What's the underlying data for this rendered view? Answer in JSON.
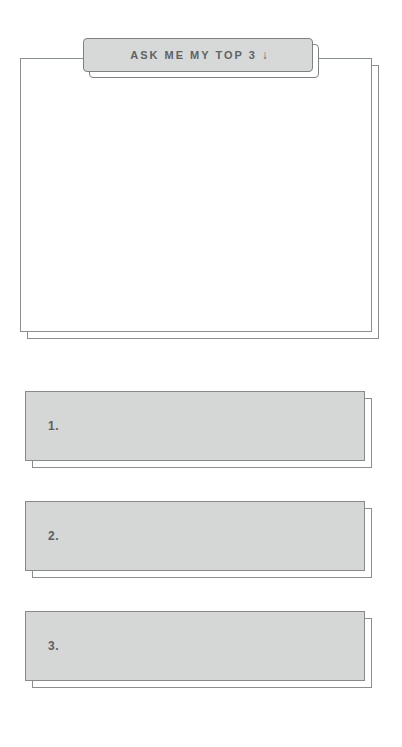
{
  "prompt_card": {
    "tab_label": "ASK ME MY TOP 3",
    "tab_arrow": "↓",
    "body_text": ""
  },
  "answers": [
    {
      "marker": "1.",
      "text": ""
    },
    {
      "marker": "2.",
      "text": ""
    },
    {
      "marker": "3.",
      "text": ""
    }
  ],
  "colors": {
    "page_background": "#ffffff",
    "card_fill": "#ffffff",
    "tab_fill": "#d7d8d8",
    "bar_fill": "#d5d6d6",
    "outline": "#87898a",
    "text": "#5e6365"
  }
}
